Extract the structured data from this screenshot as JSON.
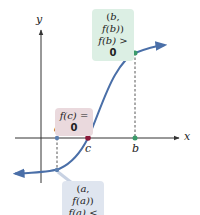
{
  "figure": {
    "axes": {
      "x_label": "x",
      "y_label": "y"
    },
    "points": {
      "a": {
        "label": "a",
        "color": "#5b7fb0"
      },
      "c": {
        "label": "c",
        "color": "#8b1a3a"
      },
      "b": {
        "label": "b",
        "color": "#3a9b6a"
      }
    },
    "callouts": {
      "b": {
        "line1_open": "(",
        "line1_var": "b",
        "line1_mid": ", ",
        "line1_fn": "f",
        "line1_arg": "(b)",
        "line1_close": ")",
        "line2_fn": "f",
        "line2_arg": "(b)",
        "line2_rel": " > ",
        "line2_val": "0",
        "bg": "#dcefe4"
      },
      "c": {
        "fn": "f",
        "arg": "(c)",
        "rel": " = ",
        "val": "0",
        "bg": "#ead9dd"
      },
      "a": {
        "line1_open": "(",
        "line1_var": "a",
        "line1_mid": ", ",
        "line1_fn": "f",
        "line1_arg": "(a)",
        "line1_close": ")",
        "line2_fn": "f",
        "line2_arg": "(a)",
        "line2_rel": " < ",
        "line2_val": "0",
        "bg": "#dfe5ef"
      }
    },
    "colors": {
      "curve": "#4a6fa8",
      "axis": "#333333",
      "dashed": "#444444"
    }
  }
}
